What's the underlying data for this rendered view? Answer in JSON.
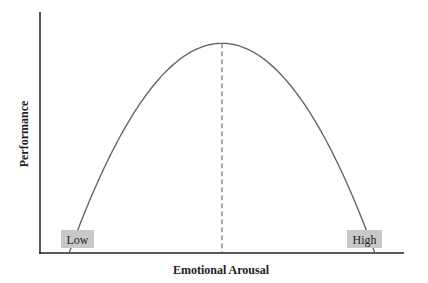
{
  "chart_data": {
    "type": "line",
    "title": "",
    "xlabel": "Emotional Arousal",
    "ylabel": "Performance",
    "x_range": [
      0,
      1
    ],
    "y_range": [
      0,
      1
    ],
    "grid": false,
    "legend": "none",
    "curve": {
      "name": "inverted-U (Yerkes–Dodson)",
      "shape": "inverted-parabola",
      "peak": {
        "x": 0.5,
        "y": 0.87
      },
      "x_intercepts": [
        0.08,
        0.92
      ]
    },
    "reference_line": {
      "style": "dashed",
      "x": 0.5,
      "from_y": 0,
      "to_y": 0.87
    },
    "annotations": [
      {
        "text": "Low",
        "position": "bottom-left"
      },
      {
        "text": "High",
        "position": "bottom-right"
      }
    ]
  },
  "colors": {
    "axis": "#222222",
    "curve": "#666666",
    "dashed": "#555555",
    "label_box": "#c8c8c8"
  }
}
